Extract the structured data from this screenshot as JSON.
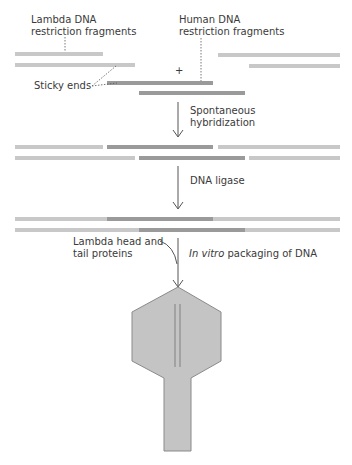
{
  "labels": {
    "lambda_fragments_l1": "Lambda DNA",
    "lambda_fragments_l2": "restriction fragments",
    "human_fragments_l1": "Human DNA",
    "human_fragments_l2": "restriction fragments",
    "sticky_ends": "Sticky ends",
    "plus": "+",
    "step1_l1": "Spontaneous",
    "step1_l2": "hybridization",
    "step2": "DNA ligase",
    "proteins_l1": "Lambda head and",
    "proteins_l2": "tail proteins",
    "step3_italic": "In vitro",
    "step3_rest": " packaging of DNA"
  },
  "colors": {
    "lambda_dna": "#c8c8c8",
    "human_dna": "#9a9a9a",
    "phage_fill": "#c4c4c4",
    "phage_stroke": "#8a8a8a",
    "arrow": "#555555"
  }
}
